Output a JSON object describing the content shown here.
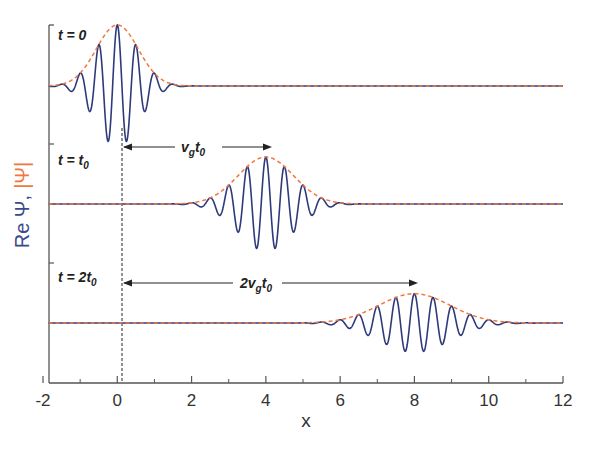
{
  "chart_data": {
    "type": "line",
    "title": "",
    "xlabel": "x",
    "ylabel": "Re Ψ, |Ψ|",
    "ylabel_parts": [
      {
        "text": "Re Ψ,",
        "color": "#3a4a8a"
      },
      {
        "text": "|Ψ|",
        "color": "#f07840"
      }
    ],
    "xlim": [
      -2,
      12
    ],
    "x_ticks": [
      -2,
      0,
      2,
      4,
      6,
      8,
      10,
      12
    ],
    "x_tick_labels": [
      "-2",
      "0",
      "2",
      "4",
      "6",
      "8",
      "10",
      "12"
    ],
    "x_minor_ticks": [
      -1,
      1,
      3,
      5,
      7,
      9,
      11
    ],
    "grid": false,
    "legend": null,
    "series": [
      {
        "name": "Re Ψ (t = 0)",
        "style": "solid",
        "color": "#2e3a7a",
        "center": 0,
        "amplitude": 1.0,
        "width": 0.8,
        "wavenumber": 12.5
      },
      {
        "name": "|Ψ| (t = 0)",
        "style": "dashed",
        "color": "#f07840",
        "center": 0,
        "amplitude": 1.0,
        "width": 0.8
      },
      {
        "name": "Re Ψ (t = t0)",
        "style": "solid",
        "color": "#2e3a7a",
        "center": 4,
        "amplitude": 0.77,
        "width": 1.05,
        "wavenumber": 12.5
      },
      {
        "name": "|Ψ| (t = t0)",
        "style": "dashed",
        "color": "#f07840",
        "center": 4,
        "amplitude": 0.77,
        "width": 1.05
      },
      {
        "name": "Re Ψ (t = 2t0)",
        "style": "solid",
        "color": "#2e3a7a",
        "center": 8,
        "amplitude": 0.48,
        "width": 1.35,
        "wavenumber": 12.5
      },
      {
        "name": "|Ψ| (t = 2t0)",
        "style": "dashed",
        "color": "#f07840",
        "center": 8,
        "amplitude": 0.48,
        "width": 1.35
      }
    ],
    "panels": [
      {
        "label": "t = 0",
        "center": 0
      },
      {
        "label": "t = t0",
        "center": 4
      },
      {
        "label": "t = 2t0",
        "center": 8
      }
    ],
    "annotations": [
      {
        "text": "v_g t_0",
        "type": "arrow",
        "from_x": 0,
        "to_x": 4
      },
      {
        "text": "2v_g t_0",
        "type": "arrow",
        "from_x": 0,
        "to_x": 8
      },
      {
        "type": "vline-dashed",
        "x": 0
      }
    ]
  },
  "labels": {
    "xlabel": "x",
    "ylabel_re": "Re Ψ,",
    "ylabel_abs": "|Ψ|",
    "panel1": {
      "main": "t = 0"
    },
    "panel2": {
      "main": "t = t",
      "sub": "0"
    },
    "panel3": {
      "main": "t = 2t",
      "sub": "0"
    },
    "arrow1": {
      "v": "v",
      "g": "g",
      "t": "t",
      "zero": "0"
    },
    "arrow2": {
      "two": "2",
      "v": "v",
      "g": "g",
      "t": "t",
      "zero": "0"
    },
    "ticks": [
      "-2",
      "0",
      "2",
      "4",
      "6",
      "8",
      "10",
      "12"
    ]
  },
  "colors": {
    "wave": "#2e3a7a",
    "envelope": "#f07840",
    "axis": "#555555"
  }
}
